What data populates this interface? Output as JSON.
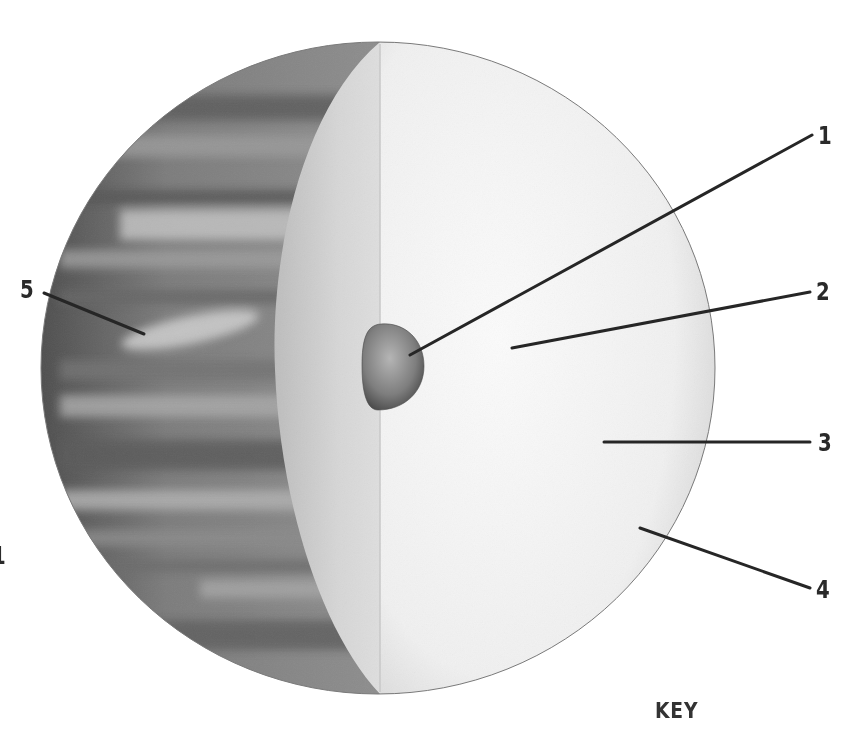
{
  "diagram": {
    "key_label": "KEY",
    "labels": [
      {
        "id": "1",
        "text": "1",
        "points_to": "core"
      },
      {
        "id": "2",
        "text": "2",
        "points_to": "inner-layer"
      },
      {
        "id": "3",
        "text": "3",
        "points_to": "middle-layer"
      },
      {
        "id": "4",
        "text": "4",
        "points_to": "outer-layer"
      },
      {
        "id": "5",
        "text": "5",
        "points_to": "cloud-bands"
      }
    ],
    "edge_fragment": "1"
  },
  "colors": {
    "background": "#ffffff",
    "ink": "#2a2a2a",
    "cloud_dark": "#5a5a5a",
    "cloud_mid": "#8a8a8a",
    "cloud_light": "#b8b8b8",
    "cut_face_shadow": "#c9c9c9",
    "cut_face_light": "#f2f2f2",
    "core": "#7a7a7a"
  }
}
